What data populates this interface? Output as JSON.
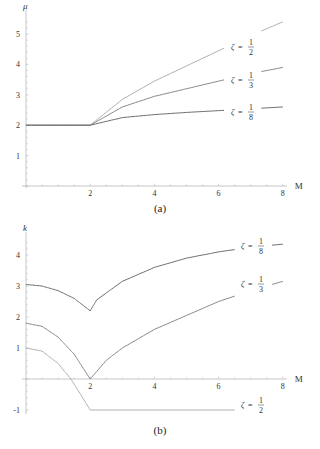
{
  "chart_data": [
    {
      "type": "line",
      "panel": "(a)",
      "caption": "(a)",
      "xlabel": "M",
      "ylabel": "μ",
      "xlim": [
        0,
        8
      ],
      "ylim": [
        0,
        5.5
      ],
      "xticks": [
        "2",
        "4",
        "6",
        "8"
      ],
      "yticks": [
        "1",
        "2",
        "3",
        "4",
        "5"
      ],
      "series": [
        {
          "name": "ζ = 1/2",
          "label_num": "1",
          "label_den": "2",
          "color": "#b0b0b0",
          "x": [
            0,
            2,
            3,
            4,
            5,
            6,
            7,
            8
          ],
          "y": [
            2,
            2,
            2.85,
            3.45,
            3.95,
            4.45,
            4.95,
            5.4
          ]
        },
        {
          "name": "ζ = 1/3",
          "label_num": "1",
          "label_den": "3",
          "color": "#8a8a8a",
          "x": [
            0,
            2,
            3,
            4,
            5,
            6,
            7,
            8
          ],
          "y": [
            2,
            2,
            2.6,
            2.95,
            3.2,
            3.45,
            3.7,
            3.9
          ]
        },
        {
          "name": "ζ = 1/8",
          "label_num": "1",
          "label_den": "8",
          "color": "#6e6e6e",
          "x": [
            0,
            2,
            3,
            4,
            5,
            6,
            7,
            8
          ],
          "y": [
            2,
            2,
            2.25,
            2.35,
            2.42,
            2.48,
            2.54,
            2.6
          ]
        }
      ]
    },
    {
      "type": "line",
      "panel": "(b)",
      "caption": "(b)",
      "xlabel": "M",
      "ylabel": "k",
      "xlim": [
        0,
        8
      ],
      "ylim": [
        -1,
        4.5
      ],
      "xticks": [
        "2",
        "4",
        "6",
        "8"
      ],
      "yticks": [
        "-1",
        "1",
        "2",
        "3",
        "4"
      ],
      "series": [
        {
          "name": "ζ = 1/8",
          "label_num": "1",
          "label_den": "8",
          "color": "#6e6e6e",
          "x": [
            0,
            0.5,
            1,
            1.5,
            2,
            2.2,
            3,
            4,
            5,
            6,
            7,
            8
          ],
          "y": [
            3.05,
            3.0,
            2.85,
            2.6,
            2.2,
            2.55,
            3.15,
            3.6,
            3.9,
            4.1,
            4.25,
            4.35
          ]
        },
        {
          "name": "ζ = 1/3",
          "label_num": "1",
          "label_den": "3",
          "color": "#8a8a8a",
          "x": [
            0,
            0.5,
            1,
            1.5,
            2,
            2.5,
            3,
            4,
            5,
            6,
            7,
            8
          ],
          "y": [
            1.8,
            1.7,
            1.35,
            0.8,
            0.0,
            0.6,
            1.0,
            1.6,
            2.05,
            2.5,
            2.85,
            3.15
          ]
        },
        {
          "name": "ζ = 1/2",
          "label_num": "1",
          "label_den": "2",
          "color": "#b0b0b0",
          "x": [
            0,
            0.5,
            1,
            1.4,
            1.7,
            2,
            8
          ],
          "y": [
            1.0,
            0.9,
            0.5,
            0.0,
            -0.5,
            -1.0,
            -1.0
          ]
        }
      ]
    }
  ],
  "labels": {
    "zeta": "ζ",
    "eq": "=",
    "mu": "μ",
    "k": "k",
    "M": "M",
    "cap_a": "(a)",
    "cap_b": "(b)"
  }
}
